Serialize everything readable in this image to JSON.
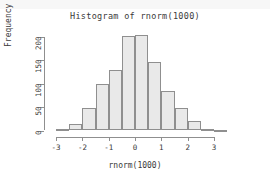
{
  "chart_data": {
    "type": "bar",
    "title": "Histogram of rnorm(1000)",
    "xlabel": "rnorm(1000)",
    "ylabel": "Frequency",
    "grid": false,
    "legend": null,
    "xlim": [
      -3.25,
      3.55
    ],
    "ylim": [
      0,
      210
    ],
    "xticks": [
      "-3",
      "-2",
      "-1",
      "0",
      "1",
      "2",
      "3"
    ],
    "xtick_values": [
      -3,
      -2,
      -1,
      0,
      1,
      2,
      3
    ],
    "yticks": [
      "0",
      "50",
      "100",
      "150",
      "200"
    ],
    "ytick_values": [
      0,
      50,
      100,
      150,
      200
    ],
    "bin_width": 0.5,
    "bin_edges": [
      -3.0,
      -2.5,
      -2.0,
      -1.5,
      -1.0,
      -0.5,
      0.0,
      0.5,
      1.0,
      1.5,
      2.0,
      2.5,
      3.0,
      3.5
    ],
    "bins": [
      {
        "from": -3.0,
        "to": -2.5,
        "value": 4
      },
      {
        "from": -2.5,
        "to": -2.0,
        "value": 13
      },
      {
        "from": -2.0,
        "to": -1.5,
        "value": 47
      },
      {
        "from": -1.5,
        "to": -1.0,
        "value": 99
      },
      {
        "from": -1.0,
        "to": -0.5,
        "value": 129
      },
      {
        "from": -0.5,
        "to": 0.0,
        "value": 201
      },
      {
        "from": 0.0,
        "to": 0.5,
        "value": 203
      },
      {
        "from": 0.5,
        "to": 1.0,
        "value": 147
      },
      {
        "from": 1.0,
        "to": 1.5,
        "value": 84
      },
      {
        "from": 1.5,
        "to": 2.0,
        "value": 47
      },
      {
        "from": 2.0,
        "to": 2.5,
        "value": 21
      },
      {
        "from": 2.5,
        "to": 3.0,
        "value": 4
      },
      {
        "from": 3.0,
        "to": 3.5,
        "value": 1
      }
    ],
    "categories": [
      "-3.0",
      "-2.5",
      "-2.0",
      "-1.5",
      "-1.0",
      "-0.5",
      "0.0",
      "0.5",
      "1.0",
      "1.5",
      "2.0",
      "2.5",
      "3.0"
    ],
    "values": [
      4,
      13,
      47,
      99,
      129,
      201,
      203,
      147,
      84,
      47,
      21,
      4,
      1
    ]
  },
  "colors": {
    "bar_fill": "#e9e9e9",
    "bar_border": "#8f8f8f",
    "axis": "#8f8f8f",
    "text": "#3a3a3a",
    "background": "#ffffff",
    "top_strip": "#f7f7f7"
  }
}
